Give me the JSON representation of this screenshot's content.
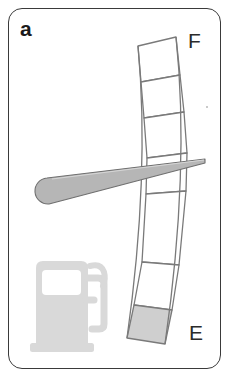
{
  "figure": {
    "panel_letter": "a",
    "kind": "fuel-gauge-illustration",
    "background_color": "#ffffff",
    "frame_border_color": "#3a3a3a"
  },
  "gauge": {
    "full_label": "F",
    "empty_label": "E",
    "segment_count": 6,
    "filled_segment_indices": [
      5
    ],
    "segment_fill_color": "#cfcfcf",
    "segment_empty_color": "#ffffff",
    "segment_outline_color": "#7a7a7a",
    "needle": {
      "color": "#b6b6b6",
      "outline_color": "#6f6f6f",
      "tip_x": 205,
      "tip_y": 160,
      "tail_x": 36,
      "tail_y": 188
    }
  },
  "pump_icon": {
    "name": "fuel-pump-icon",
    "color": "#d9d9d9",
    "window_color": "#ffffff"
  }
}
